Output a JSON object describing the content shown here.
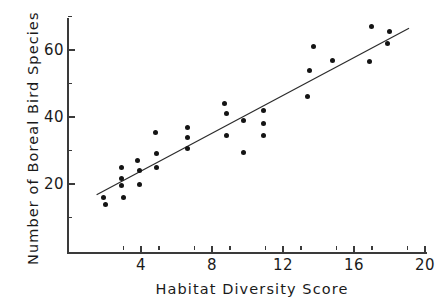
{
  "chart_data": {
    "type": "scatter",
    "title": "",
    "xlabel": "Habitat Diversity Score",
    "ylabel": "Number of Boreal Bird Species",
    "xlim": [
      1.0,
      20.2
    ],
    "ylim": [
      4.0,
      70.0
    ],
    "grid": false,
    "legend": null,
    "x_ticks_major": [
      4,
      8,
      12,
      16,
      20
    ],
    "x_tick_labels": [
      "4",
      "8",
      "12",
      "16",
      "20"
    ],
    "x_ticks_minor": [
      3,
      5,
      7,
      9,
      11,
      13,
      15,
      17,
      19
    ],
    "y_ticks_major": [
      20,
      40,
      60
    ],
    "y_tick_labels": [
      "20",
      "40",
      "60"
    ],
    "y_ticks_minor": [
      10,
      30,
      50,
      70
    ],
    "points": [
      {
        "x": 1.9,
        "y": 16
      },
      {
        "x": 2.0,
        "y": 14
      },
      {
        "x": 2.9,
        "y": 25
      },
      {
        "x": 2.9,
        "y": 21.5
      },
      {
        "x": 2.9,
        "y": 19.5
      },
      {
        "x": 3.0,
        "y": 16
      },
      {
        "x": 3.8,
        "y": 27
      },
      {
        "x": 3.9,
        "y": 24
      },
      {
        "x": 3.9,
        "y": 20
      },
      {
        "x": 4.8,
        "y": 35.5
      },
      {
        "x": 4.85,
        "y": 29
      },
      {
        "x": 4.9,
        "y": 25
      },
      {
        "x": 6.6,
        "y": 37
      },
      {
        "x": 6.6,
        "y": 34
      },
      {
        "x": 6.6,
        "y": 30.5
      },
      {
        "x": 8.7,
        "y": 44
      },
      {
        "x": 8.8,
        "y": 41
      },
      {
        "x": 8.8,
        "y": 34.5
      },
      {
        "x": 9.8,
        "y": 39
      },
      {
        "x": 9.8,
        "y": 29.5
      },
      {
        "x": 10.9,
        "y": 42
      },
      {
        "x": 10.9,
        "y": 38
      },
      {
        "x": 10.9,
        "y": 34.5
      },
      {
        "x": 13.4,
        "y": 46
      },
      {
        "x": 13.5,
        "y": 54
      },
      {
        "x": 13.7,
        "y": 61
      },
      {
        "x": 14.8,
        "y": 57
      },
      {
        "x": 16.9,
        "y": 56.5
      },
      {
        "x": 17.0,
        "y": 67
      },
      {
        "x": 17.9,
        "y": 62
      },
      {
        "x": 18.0,
        "y": 65.5
      }
    ],
    "trendline": {
      "type": "linear-fit",
      "x_start": 1.5,
      "y_start": 16.8,
      "x_end": 19.1,
      "y_end": 66.5
    }
  }
}
